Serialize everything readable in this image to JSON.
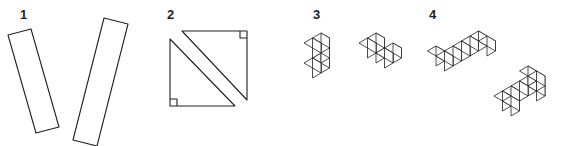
{
  "figures": [
    {
      "label": "1",
      "description": "two rectangles (strips)"
    },
    {
      "label": "2",
      "description": "square split into two right triangles"
    },
    {
      "label": "3",
      "description": "two five-cube solids"
    },
    {
      "label": "4",
      "description": "two seven-cube solids"
    }
  ],
  "colors": {
    "ink": "#231f20",
    "background": "#ffffff"
  }
}
